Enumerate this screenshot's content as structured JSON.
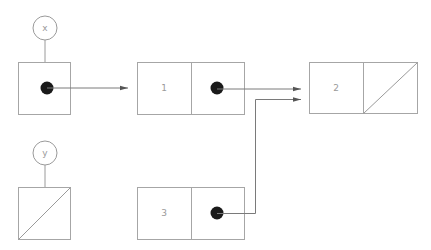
{
  "diagram": {
    "type": "box-and-pointer",
    "colors": {
      "line": "#9a9a9a",
      "box": "#a6a6a6",
      "pointer_dot": "#1a1a1a",
      "text": "#9a9a9a"
    },
    "variables": [
      {
        "name": "x",
        "points_to": "node-1"
      },
      {
        "name": "y",
        "points_to": "null"
      }
    ],
    "nodes": [
      {
        "id": "node-1",
        "value": "1",
        "next": "node-2"
      },
      {
        "id": "node-2",
        "value": "2",
        "next": "null"
      },
      {
        "id": "node-3",
        "value": "3",
        "next": "node-2"
      }
    ]
  }
}
